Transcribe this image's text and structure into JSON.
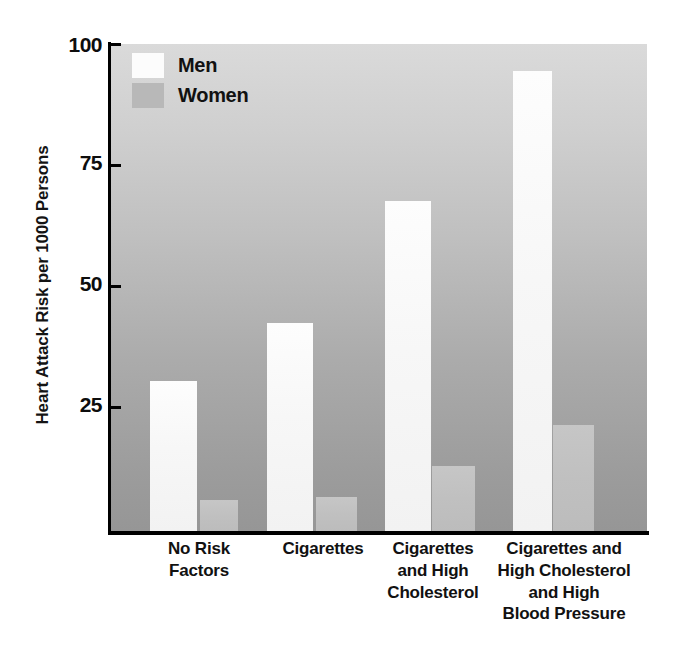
{
  "chart_data": {
    "type": "bar",
    "title": "",
    "xlabel": "",
    "ylabel": "Heart Attack Risk per 1000 Persons",
    "categories": [
      "No Risk Factors",
      "Cigarettes",
      "Cigarettes and High Cholesterol",
      "Cigarettes and High Cholesterol and High Blood Pressure"
    ],
    "series": [
      {
        "name": "Men",
        "values": [
          31,
          43,
          68,
          95
        ],
        "color": "#fcfcfc"
      },
      {
        "name": "Women",
        "values": [
          6,
          7,
          13,
          22
        ],
        "color": "#b8b8b8"
      }
    ],
    "ylim": [
      0,
      100
    ],
    "yticks": [
      25,
      50,
      75,
      100
    ],
    "grid": false,
    "legend_position": "top-left",
    "background": "vertical gray gradient light to medium"
  },
  "axis": {
    "y_title": "Heart Attack Risk per 1000 Persons",
    "y_ticks": [
      {
        "value": "100"
      },
      {
        "value": "75"
      },
      {
        "value": "50"
      },
      {
        "value": "25"
      }
    ]
  },
  "legend": {
    "items": [
      {
        "label": "Men"
      },
      {
        "label": "Women"
      }
    ]
  },
  "x_labels": [
    {
      "lines": "No Risk\nFactors"
    },
    {
      "lines": "Cigarettes"
    },
    {
      "lines": "Cigarettes\nand High\nCholesterol"
    },
    {
      "lines": "Cigarettes and\nHigh Cholesterol\nand High\nBlood Pressure"
    }
  ],
  "colors": {
    "men_bar": "#fcfcfc",
    "women_bar": "#bfbfbf",
    "axis": "#000000",
    "text": "#111111",
    "plot_bg_top": "#dadada",
    "plot_bg_bottom": "#969696"
  }
}
